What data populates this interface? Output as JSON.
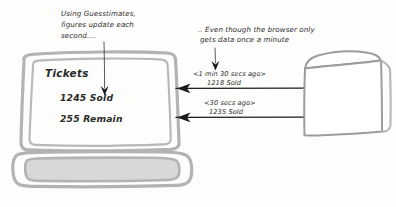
{
  "diagram": {
    "style": "hand-drawn whiteboard sketch",
    "colors": {
      "ink": "#1b1b1b",
      "sketch_gray": "#b3b3b3",
      "sketch_fill": "#d8d8d8",
      "background": "#fdfdfc"
    }
  },
  "annotations": {
    "left_note": {
      "line1": "Using Guesstimates,",
      "line2": "figures update each",
      "line3": "second...."
    },
    "right_note": {
      "line1": ".. Even though the browser only",
      "line2": "gets data once a minute"
    }
  },
  "laptop": {
    "name": "browser-laptop",
    "screen": {
      "heading": "Tickets",
      "sold_line": "1245 Sold",
      "remain_line": "255 Remain"
    }
  },
  "server": {
    "name": "server-cube",
    "label": ""
  },
  "messages": [
    {
      "timestamp": "<1 min 30 secs ago>",
      "payload": "1218 Sold",
      "direction": "server-to-browser"
    },
    {
      "timestamp": "<30 secs ago>",
      "payload": "1235 Sold",
      "direction": "server-to-browser"
    }
  ]
}
